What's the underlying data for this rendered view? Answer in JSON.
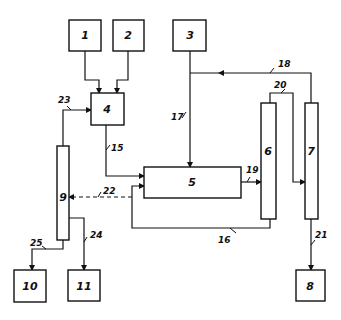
{
  "diagram": {
    "type": "process-flow-block-diagram",
    "nodes": [
      {
        "id": "1",
        "label": "1",
        "shape": "box"
      },
      {
        "id": "2",
        "label": "2",
        "shape": "box"
      },
      {
        "id": "3",
        "label": "3",
        "shape": "box"
      },
      {
        "id": "4",
        "label": "4",
        "shape": "box"
      },
      {
        "id": "5",
        "label": "5",
        "shape": "box"
      },
      {
        "id": "6",
        "label": "6",
        "shape": "column"
      },
      {
        "id": "7",
        "label": "7",
        "shape": "column"
      },
      {
        "id": "8",
        "label": "8",
        "shape": "box"
      },
      {
        "id": "9",
        "label": "9",
        "shape": "column"
      },
      {
        "id": "10",
        "label": "10",
        "shape": "box"
      },
      {
        "id": "11",
        "label": "11",
        "shape": "box"
      }
    ],
    "streams": [
      {
        "ref": "",
        "from": "1",
        "to": "4",
        "style": "solid"
      },
      {
        "ref": "",
        "from": "2",
        "to": "4",
        "style": "solid"
      },
      {
        "ref": "17",
        "from": "3",
        "to": "5",
        "style": "solid"
      },
      {
        "ref": "15",
        "from": "4",
        "to": "5",
        "style": "solid"
      },
      {
        "ref": "19",
        "from": "5",
        "to": "6",
        "style": "solid"
      },
      {
        "ref": "20",
        "from": "6",
        "to": "7",
        "style": "solid"
      },
      {
        "ref": "18",
        "from": "7",
        "to": "17",
        "style": "solid"
      },
      {
        "ref": "16",
        "from": "6",
        "to": "5",
        "style": "solid"
      },
      {
        "ref": "21",
        "from": "7",
        "to": "8",
        "style": "solid"
      },
      {
        "ref": "22",
        "from": "5",
        "to": "9",
        "style": "dashed"
      },
      {
        "ref": "23",
        "from": "9",
        "to": "4",
        "style": "solid"
      },
      {
        "ref": "24",
        "from": "9",
        "to": "11",
        "style": "solid"
      },
      {
        "ref": "25",
        "from": "9",
        "to": "10",
        "style": "solid"
      }
    ]
  },
  "labels": {
    "n1": "1",
    "n2": "2",
    "n3": "3",
    "n4": "4",
    "n5": "5",
    "n6": "6",
    "n7": "7",
    "n8": "8",
    "n9": "9",
    "n10": "10",
    "n11": "11",
    "s15": "15",
    "s16": "16",
    "s17": "17",
    "s18": "18",
    "s19": "19",
    "s20": "20",
    "s21": "21",
    "s22": "22",
    "s23": "23",
    "s24": "24",
    "s25": "25"
  }
}
